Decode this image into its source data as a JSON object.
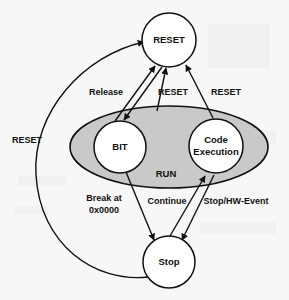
{
  "diagram": {
    "background_color": "#f7f7f7",
    "line_color": "#111111",
    "run_region_fill": "#c9c9c9",
    "node_fill": "#ffffff"
  },
  "states": [
    {
      "id": "reset",
      "label": "RESET",
      "cx": 169,
      "cy": 40,
      "r": 27
    },
    {
      "id": "bit",
      "label": "BIT",
      "cx": 120,
      "cy": 147,
      "r": 26
    },
    {
      "id": "code_execution",
      "label_line1": "Code",
      "label_line2": "Execution",
      "cx": 216,
      "cy": 146,
      "r": 27
    },
    {
      "id": "stop",
      "label": "Stop",
      "cx": 169,
      "cy": 262,
      "r": 26
    }
  ],
  "regions": [
    {
      "id": "run",
      "label": "RUN",
      "cx": 169,
      "cy": 147,
      "rx": 99,
      "ry": 41,
      "label_x": 166,
      "label_y": 174
    }
  ],
  "edges": [
    {
      "id": "bit-to-reset",
      "label": "Release",
      "label_x": 106,
      "label_y": 93,
      "from": "bit",
      "to": "reset"
    },
    {
      "id": "reset-to-bit",
      "label": "",
      "from": "reset",
      "to": "bit"
    },
    {
      "id": "bit-reset-return",
      "label": "RESET",
      "label_x": 173,
      "label_y": 93,
      "from": "bit",
      "to": "reset"
    },
    {
      "id": "code-to-reset",
      "label": "RESET",
      "label_x": 226,
      "label_y": 93,
      "from": "code_execution",
      "to": "reset"
    },
    {
      "id": "stop-to-reset",
      "label": "RESET",
      "label_x": 27,
      "label_y": 141,
      "from": "stop",
      "to": "reset"
    },
    {
      "id": "bit-to-stop",
      "label_line1": "Break at",
      "label_line2": "0x0000",
      "label_x": 104,
      "label_y": 199,
      "from": "bit",
      "to": "stop"
    },
    {
      "id": "stop-to-code",
      "label": "Continue",
      "label_x": 167,
      "label_y": 202,
      "from": "stop",
      "to": "code_execution"
    },
    {
      "id": "code-to-stop",
      "label": "Stop/HW-Event",
      "label_x": 236,
      "label_y": 202,
      "from": "code_execution",
      "to": "stop"
    }
  ]
}
